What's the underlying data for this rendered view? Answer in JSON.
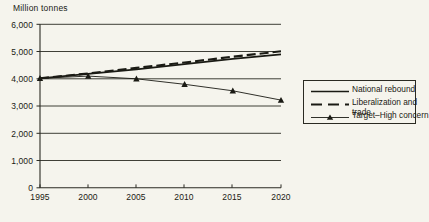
{
  "chart_data": {
    "type": "line",
    "title": "Million tonnes",
    "xlabel": "",
    "ylabel": "Million tonnes",
    "x": [
      1995,
      2000,
      2005,
      2010,
      2015,
      2020
    ],
    "categories": [
      "1995",
      "2000",
      "2005",
      "2010",
      "2015",
      "2020"
    ],
    "xlim": [
      1995,
      2020
    ],
    "ylim": [
      0,
      6000
    ],
    "ytick_labels": [
      "0",
      "1,000",
      "2,000",
      "3,000",
      "4,000",
      "5,000",
      "6,000"
    ],
    "ytick_values": [
      0,
      1000,
      2000,
      3000,
      4000,
      5000,
      6000
    ],
    "grid": "horizontal",
    "legend_position": "right",
    "series": [
      {
        "name": "National rebound",
        "style": "solid",
        "marker": "none",
        "color": "#1a1a14",
        "values": [
          4020,
          4180,
          4350,
          4540,
          4730,
          4900
        ]
      },
      {
        "name": "Liberalization and trade",
        "style": "dashed",
        "marker": "none",
        "color": "#1a1a14",
        "values": [
          4020,
          4200,
          4400,
          4600,
          4810,
          5010
        ]
      },
      {
        "name": "Target–High concern",
        "style": "solid",
        "marker": "triangle",
        "color": "#1a1a14",
        "values": [
          4020,
          4100,
          4000,
          3800,
          3560,
          3220
        ]
      }
    ]
  },
  "axis": {
    "title": "Million tonnes",
    "y_labels": [
      "6,000",
      "5,000",
      "4,000",
      "3,000",
      "2,000",
      "1,000",
      "0"
    ],
    "x_labels": [
      "1995",
      "2000",
      "2005",
      "2010",
      "2015",
      "2020"
    ]
  },
  "legend": {
    "entries": [
      {
        "label": "National rebound",
        "style": "solid",
        "marker": "none"
      },
      {
        "label": "Liberalization and trade",
        "style": "dashed",
        "marker": "none"
      },
      {
        "label": "Target–High concern",
        "style": "solid",
        "marker": "triangle"
      }
    ]
  },
  "colors": {
    "background": "#f5f4ed",
    "ink": "#1a1a14",
    "grid": "#2a2a22"
  }
}
